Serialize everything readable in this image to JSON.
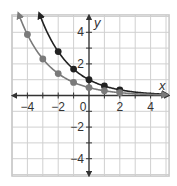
{
  "chart_data": {
    "type": "line",
    "title": "",
    "xlabel": "x",
    "ylabel": "y",
    "xlim": [
      -5,
      5.2
    ],
    "ylim": [
      -5.1,
      5.1
    ],
    "grid": true,
    "legend": null,
    "x_ticks": [
      -4,
      -2,
      0,
      2,
      4
    ],
    "x_tick_labels": [
      "−4",
      "−2",
      "0",
      "2",
      "4"
    ],
    "y_ticks": [
      4,
      2,
      -2,
      -4
    ],
    "y_tick_labels": [
      "4",
      "2",
      "−2",
      "−4"
    ],
    "series": [
      {
        "name": "dark-curve",
        "function": "y = 0.6^x",
        "color": "#222222",
        "points_x": [
          -2,
          -1,
          0,
          1,
          2
        ],
        "points_y": [
          2.78,
          1.67,
          1,
          0.6,
          0.36
        ]
      },
      {
        "name": "gray-curve",
        "function": "y = 0.5 * 0.6^x",
        "color": "#7a7a7a",
        "points_x": [
          -4,
          -3,
          -2,
          -1,
          0,
          1,
          2
        ],
        "points_y": [
          3.86,
          2.31,
          1.39,
          0.83,
          0.5,
          0.3,
          0.18
        ]
      }
    ]
  },
  "colors": {
    "grid": "#d0d0d0",
    "frame": "#c8c8c8",
    "axis": "#333333"
  }
}
